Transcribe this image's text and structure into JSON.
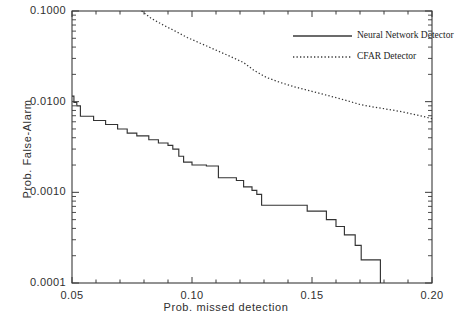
{
  "chart_data": {
    "type": "line",
    "title": "",
    "xlabel": "Prob. missed detection",
    "ylabel": "Prob. False-Alarm",
    "xlim": [
      0.05,
      0.2
    ],
    "ylim": [
      0.0001,
      0.1
    ],
    "yscale": "log",
    "xscale": "linear",
    "grid": false,
    "legend_position": "top-right",
    "xticks": [
      "0.05",
      "0.10",
      "0.15",
      "0.20"
    ],
    "xtick_values": [
      0.05,
      0.1,
      0.15,
      0.2
    ],
    "yticks": [
      "0.1000",
      "0.0100",
      "0.0010",
      "0.0001"
    ],
    "ytick_values": [
      0.1,
      0.01,
      0.001,
      0.0001
    ],
    "series": [
      {
        "name": "Neural Network Detector",
        "style": "solid",
        "color": "#333333",
        "drawstyle": "steps-post",
        "points": [
          [
            0.05,
            0.0115
          ],
          [
            0.0508,
            0.0115
          ],
          [
            0.0508,
            0.0098
          ],
          [
            0.052,
            0.0098
          ],
          [
            0.052,
            0.009
          ],
          [
            0.0535,
            0.009
          ],
          [
            0.0535,
            0.0069
          ],
          [
            0.059,
            0.0069
          ],
          [
            0.059,
            0.0062
          ],
          [
            0.064,
            0.0062
          ],
          [
            0.064,
            0.0056
          ],
          [
            0.069,
            0.0056
          ],
          [
            0.069,
            0.005
          ],
          [
            0.073,
            0.005
          ],
          [
            0.073,
            0.0045
          ],
          [
            0.077,
            0.0045
          ],
          [
            0.077,
            0.0042
          ],
          [
            0.082,
            0.0042
          ],
          [
            0.082,
            0.0038
          ],
          [
            0.086,
            0.0038
          ],
          [
            0.086,
            0.0035
          ],
          [
            0.09,
            0.0035
          ],
          [
            0.09,
            0.0033
          ],
          [
            0.092,
            0.0033
          ],
          [
            0.092,
            0.003
          ],
          [
            0.0945,
            0.003
          ],
          [
            0.0945,
            0.0025
          ],
          [
            0.0965,
            0.0025
          ],
          [
            0.0965,
            0.00215
          ],
          [
            0.1,
            0.00215
          ],
          [
            0.1,
            0.002
          ],
          [
            0.106,
            0.002
          ],
          [
            0.106,
            0.00195
          ],
          [
            0.111,
            0.00195
          ],
          [
            0.111,
            0.00145
          ],
          [
            0.1185,
            0.00145
          ],
          [
            0.1185,
            0.00135
          ],
          [
            0.1215,
            0.00135
          ],
          [
            0.1215,
            0.00115
          ],
          [
            0.125,
            0.00115
          ],
          [
            0.125,
            0.00105
          ],
          [
            0.127,
            0.00105
          ],
          [
            0.127,
            0.00095
          ],
          [
            0.129,
            0.00095
          ],
          [
            0.129,
            0.00072
          ],
          [
            0.148,
            0.00072
          ],
          [
            0.148,
            0.00062
          ],
          [
            0.156,
            0.00062
          ],
          [
            0.156,
            0.0005
          ],
          [
            0.16,
            0.0005
          ],
          [
            0.16,
            0.00042
          ],
          [
            0.1635,
            0.00042
          ],
          [
            0.1635,
            0.00034
          ],
          [
            0.168,
            0.00034
          ],
          [
            0.168,
            0.00026
          ],
          [
            0.1705,
            0.00026
          ],
          [
            0.1705,
            0.00018
          ],
          [
            0.1785,
            0.00018
          ],
          [
            0.1785,
            0.0001
          ]
        ]
      },
      {
        "name": "CFAR Detector",
        "style": "dotted",
        "color": "#333333",
        "drawstyle": "default",
        "points": [
          [
            0.079,
            0.1
          ],
          [
            0.083,
            0.083
          ],
          [
            0.088,
            0.07
          ],
          [
            0.093,
            0.06
          ],
          [
            0.098,
            0.051
          ],
          [
            0.104,
            0.0435
          ],
          [
            0.11,
            0.037
          ],
          [
            0.116,
            0.0315
          ],
          [
            0.1215,
            0.027
          ],
          [
            0.126,
            0.022
          ],
          [
            0.131,
            0.0185
          ],
          [
            0.137,
            0.0162
          ],
          [
            0.143,
            0.0145
          ],
          [
            0.149,
            0.0132
          ],
          [
            0.155,
            0.012
          ],
          [
            0.161,
            0.0109
          ],
          [
            0.166,
            0.01
          ],
          [
            0.17,
            0.0093
          ],
          [
            0.176,
            0.0087
          ],
          [
            0.182,
            0.0082
          ],
          [
            0.188,
            0.0077
          ],
          [
            0.194,
            0.0071
          ],
          [
            0.198,
            0.0067
          ],
          [
            0.2,
            0.0065
          ]
        ]
      }
    ]
  },
  "legend": {
    "entries": [
      {
        "label": "Neural Network Detector",
        "style": "solid"
      },
      {
        "label": "CFAR Detector",
        "style": "dotted"
      }
    ]
  }
}
